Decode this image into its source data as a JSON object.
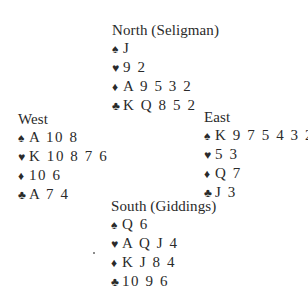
{
  "deal": {
    "north": {
      "label": "North (Seligman)",
      "spades": "J",
      "hearts": "9 2",
      "diamonds": "A 9 5 3 2",
      "clubs": "K Q 8 5 2"
    },
    "west": {
      "label": "West",
      "spades": "A 10 8",
      "hearts": "K 10 8 7 6",
      "diamonds": "10 6",
      "clubs": "A 7 4"
    },
    "east": {
      "label": "East",
      "spades": "K 9 7 5 4 3 2",
      "hearts": "5 3",
      "diamonds": "Q 7",
      "clubs": "J 3"
    },
    "south": {
      "label": "South (Giddings)",
      "spades": "Q 6",
      "hearts": "A Q J 4",
      "diamonds": "K J 8 4",
      "clubs": "10 9 6"
    }
  },
  "suit_symbols": {
    "spades": "♠",
    "hearts": "♥",
    "diamonds": "♦",
    "clubs": "♣"
  }
}
